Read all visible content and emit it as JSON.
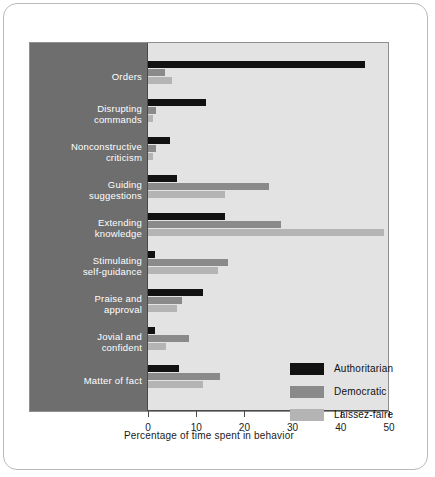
{
  "chart_data": {
    "type": "bar",
    "orientation": "horizontal",
    "title": "",
    "xlabel": "Percentage of time spent in behavior",
    "ylabel": "",
    "xlim": [
      0,
      50
    ],
    "xticks": [
      0,
      10,
      20,
      30,
      40,
      50
    ],
    "grid": false,
    "legend_position": "inside-bottom-right",
    "categories": [
      "Orders",
      "Disrupting commands",
      "Nonconstructive criticism",
      "Guiding suggestions",
      "Extending knowledge",
      "Stimulating self-guidance",
      "Praise and approval",
      "Jovial and confident",
      "Matter of fact"
    ],
    "category_lines": [
      [
        "Orders"
      ],
      [
        "Disrupting",
        "commands"
      ],
      [
        "Nonconstructive",
        "criticism"
      ],
      [
        "Guiding",
        "suggestions"
      ],
      [
        "Extending",
        "knowledge"
      ],
      [
        "Stimulating",
        "self-guidance"
      ],
      [
        "Praise and",
        "approval"
      ],
      [
        "Jovial and",
        "confident"
      ],
      [
        "Matter of fact"
      ]
    ],
    "series": [
      {
        "name": "Authoritarian",
        "color": "#121212",
        "values": [
          45.0,
          12.0,
          4.5,
          6.0,
          16.0,
          1.5,
          11.5,
          1.5,
          6.5
        ]
      },
      {
        "name": "Democratic",
        "color": "#8a8a8a",
        "values": [
          3.5,
          1.6,
          1.6,
          25.0,
          27.5,
          16.5,
          7.0,
          8.5,
          15.0
        ]
      },
      {
        "name": "Laissez-faire",
        "color": "#b4b4b4",
        "values": [
          5.0,
          1.0,
          1.0,
          16.0,
          49.0,
          14.5,
          6.0,
          3.7,
          11.5
        ]
      }
    ]
  },
  "legend": {
    "items": [
      {
        "label": "Authoritarian",
        "color": "#121212"
      },
      {
        "label": "Democratic",
        "color": "#8a8a8a"
      },
      {
        "label": "Laissez-faire",
        "color": "#b4b4b4"
      }
    ]
  }
}
